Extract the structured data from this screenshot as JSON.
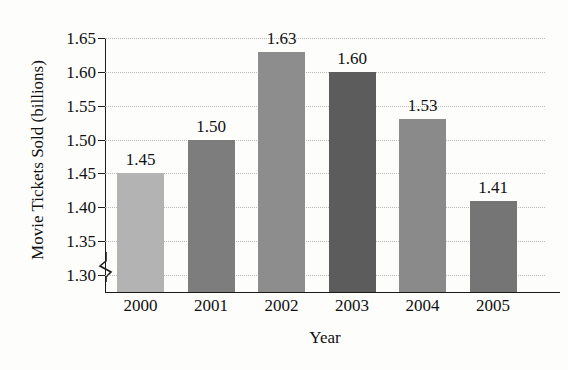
{
  "chart_data": {
    "type": "bar",
    "title": "United States Movie Attendance",
    "xlabel": "Year",
    "ylabel": "Movie Tickets Sold (billions)",
    "categories": [
      "2000",
      "2001",
      "2002",
      "2003",
      "2004",
      "2005"
    ],
    "values": [
      1.45,
      1.5,
      1.63,
      1.6,
      1.53,
      1.41
    ],
    "value_labels": [
      "1.45",
      "1.50",
      "1.63",
      "1.60",
      "1.53",
      "1.41"
    ],
    "ylim": [
      1.275,
      1.65
    ],
    "y_ticks": [
      "1.30",
      "1.35",
      "1.40",
      "1.45",
      "1.50",
      "1.55",
      "1.60",
      "1.65"
    ],
    "y_tick_values": [
      1.3,
      1.35,
      1.4,
      1.45,
      1.5,
      1.55,
      1.6,
      1.65
    ],
    "grid": true,
    "legend": false,
    "axis_break": true,
    "bar_colors": [
      "#b3b3b3",
      "#7d7d7d",
      "#8d8d8d",
      "#5c5c5c",
      "#8a8a8a",
      "#757575"
    ],
    "axis_color": "#1b1b1b",
    "gridline_color": "#b9b9b9",
    "background": "#fdfdfc"
  }
}
